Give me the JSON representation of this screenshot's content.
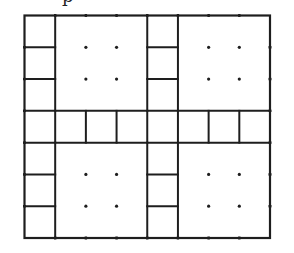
{
  "figure": {
    "cut_off_text": "p",
    "grid": {
      "columns": 8,
      "rows": 7,
      "description": "8x7 lattice split by a full middle row and a column strip into four 2x2 dotted blocks, each preceded on its left by a 1x3 strip of unit cells",
      "blocks": [
        {
          "name": "top-left-block",
          "col": 1,
          "row": 0,
          "width": 2,
          "height": 3,
          "dots": [
            [
              2,
              1
            ],
            [
              3,
              1
            ],
            [
              2,
              2
            ],
            [
              3,
              2
            ]
          ]
        },
        {
          "name": "top-right-block",
          "col": 5,
          "row": 0,
          "width": 3,
          "height": 3,
          "dots": [
            [
              6,
              1
            ],
            [
              7,
              1
            ],
            [
              6,
              2
            ],
            [
              7,
              2
            ]
          ]
        },
        {
          "name": "bottom-left-block",
          "col": 1,
          "row": 4,
          "width": 3,
          "height": 3,
          "dots": [
            [
              2,
              5
            ],
            [
              3,
              5
            ],
            [
              2,
              6
            ],
            [
              3,
              6
            ]
          ]
        },
        {
          "name": "bottom-right-block",
          "col": 5,
          "row": 4,
          "width": 3,
          "height": 3,
          "dots": [
            [
              6,
              5
            ],
            [
              7,
              5
            ],
            [
              6,
              6
            ],
            [
              7,
              6
            ]
          ]
        }
      ],
      "strips": [
        {
          "name": "top-left-strip",
          "col": 0,
          "rows": [
            0,
            1,
            2
          ]
        },
        {
          "name": "top-middle-strip",
          "col": 4,
          "rows": [
            0,
            1,
            2
          ]
        },
        {
          "name": "bottom-left-strip",
          "col": 0,
          "rows": [
            4,
            5,
            6
          ]
        },
        {
          "name": "bottom-middle-strip",
          "col": 4,
          "rows": [
            4,
            5,
            6
          ]
        }
      ],
      "middle_row": {
        "row": 3,
        "cells": 8
      }
    },
    "colors": {
      "line": "#1e1e1e",
      "background": "#ffffff"
    }
  }
}
